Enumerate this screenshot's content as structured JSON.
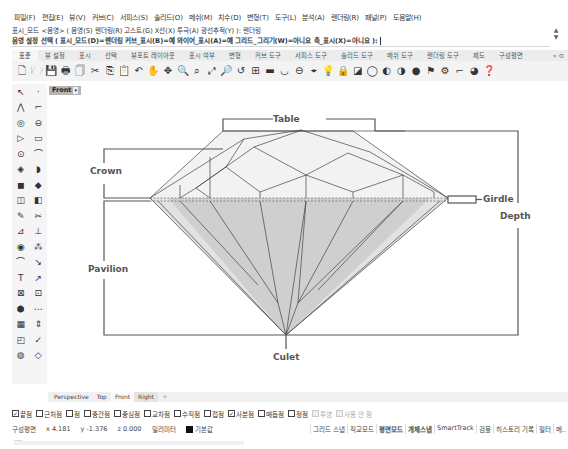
{
  "menubar": {
    "items": [
      "파일(F)",
      "편집(E)",
      "뷰(V)",
      "커브(C)",
      "서피스(S)",
      "솔리드(O)",
      "메쉬(M)",
      "치수(D)",
      "변형(T)",
      "도구(L)",
      "분석(A)",
      "렌더링(R)",
      "패널(P)",
      "도움말(H)"
    ]
  },
  "command": {
    "history_line": "표시_모드 <음영> ( 음영(S)  렌더링(R)  고스트(G)  X선(X)  투극(A)  광선추적(Y) ): 렌더링",
    "prompt_line": "음영 설정 선택 ( 표시_모드(D)=렌더링  커브_표시(B)=예  와이어_표시(A)=예  그리드_그리기(W)=아니요  축_표시(X)=아니요 ):",
    "scroll_up": "▲",
    "scroll_down": "▼"
  },
  "toolbar_tabs": {
    "tabs": [
      "표준",
      "뷰 설정",
      "표시",
      "선택",
      "뷰포트 레이아웃",
      "표시 여부",
      "변형",
      "커브 도구",
      "서피스 도구",
      "솔리드 도구",
      "메쉬 도구",
      "렌더링 도구",
      "제도",
      "구성평면"
    ],
    "active_index": 0,
    "more": "» ⊙"
  },
  "toolbar": {
    "icons": [
      {
        "name": "new-file-icon",
        "glyph": "🗋"
      },
      {
        "name": "open-folder-icon",
        "glyph": "🗁"
      },
      {
        "name": "save-icon",
        "glyph": "💾"
      },
      {
        "name": "print-icon",
        "glyph": "🖶"
      },
      {
        "name": "import-icon",
        "glyph": "🗍"
      },
      {
        "name": "cut-icon",
        "glyph": "✂"
      },
      {
        "name": "copy-icon",
        "glyph": "⎘"
      },
      {
        "name": "paste-icon",
        "glyph": "📋"
      },
      {
        "name": "undo-icon",
        "glyph": "↶"
      },
      {
        "name": "pan-hand-icon",
        "glyph": "✋"
      },
      {
        "name": "rotate-view-icon",
        "glyph": "✥"
      },
      {
        "name": "zoom-dynamic-icon",
        "glyph": "🔍"
      },
      {
        "name": "zoom-window-icon",
        "glyph": "⌕"
      },
      {
        "name": "zoom-extents-icon",
        "glyph": "⤢"
      },
      {
        "name": "zoom-selected-icon",
        "glyph": "🔎"
      },
      {
        "name": "undo-view-icon",
        "glyph": "↺"
      },
      {
        "name": "viewport-layout-icon",
        "glyph": "⊞"
      },
      {
        "name": "cplane-icon",
        "glyph": "▬"
      },
      {
        "name": "set-view-icon",
        "glyph": "◡"
      },
      {
        "name": "named-view-icon",
        "glyph": "⊖"
      },
      {
        "name": "osnap-icon",
        "glyph": "⌖"
      },
      {
        "name": "light-bulb-icon",
        "glyph": "💡"
      },
      {
        "name": "lock-icon",
        "glyph": "🔒"
      },
      {
        "name": "layer-icon",
        "glyph": "◪"
      },
      {
        "name": "wireframe-sphere-icon",
        "glyph": "◯"
      },
      {
        "name": "shaded-sphere-icon",
        "glyph": "◐"
      },
      {
        "name": "rendered-sphere-icon",
        "glyph": "◑"
      },
      {
        "name": "render-sphere-icon",
        "glyph": "●"
      },
      {
        "name": "material-icon",
        "glyph": "⚑"
      },
      {
        "name": "settings-gear-icon",
        "glyph": "⚙"
      },
      {
        "name": "dimension-icon",
        "glyph": "⌐"
      },
      {
        "name": "environment-icon",
        "glyph": "◕"
      },
      {
        "name": "help-icon",
        "glyph": "❓"
      }
    ]
  },
  "sidebar": {
    "rows": [
      [
        "select-arrow-icon",
        "point-icon"
      ],
      [
        "polyline-icon",
        "curve-control-points-icon"
      ],
      [
        "circle-icon",
        "ellipse-icon"
      ],
      [
        "arc-icon",
        "rectangle-icon"
      ],
      [
        "polygon-icon",
        "fillet-curve-icon"
      ],
      [
        "surface-icon",
        "extrude-surface-icon"
      ],
      [
        "box-solid-icon",
        "solid-union-icon"
      ],
      [
        "mesh-icon",
        "mesh-tools-icon"
      ],
      [
        "boolean-icon",
        "split-icon"
      ],
      [
        "trim-icon",
        "join-icon"
      ],
      [
        "group-icon",
        "explode-icon"
      ],
      [
        "move-icon",
        "fillet-edge-icon"
      ],
      [
        "text-icon",
        "dimension-tool-icon"
      ],
      [
        "block-icon",
        "array-icon"
      ],
      [
        "render-mesh-icon",
        "gumball-icon"
      ],
      [
        "grid-array-icon",
        "align-icon"
      ],
      [
        "analyze-icon",
        "check-icon"
      ],
      [
        "transform-icon",
        "cage-edit-icon"
      ]
    ],
    "glyphs": [
      [
        "↖",
        "·"
      ],
      [
        "⋀",
        "⌐"
      ],
      [
        "◎",
        "⊖"
      ],
      [
        "▷",
        "▭"
      ],
      [
        "⊙",
        "⌒"
      ],
      [
        "◈",
        "◗"
      ],
      [
        "◼",
        "◆"
      ],
      [
        "◫",
        "◧"
      ],
      [
        "✎",
        "✂"
      ],
      [
        "⊿",
        "⊥"
      ],
      [
        "◉",
        "⁂"
      ],
      [
        "⌒",
        "↘"
      ],
      [
        "T",
        "↗"
      ],
      [
        "⊠",
        "⊡"
      ],
      [
        "⬢",
        "⋯"
      ],
      [
        "▦",
        "⇕"
      ],
      [
        "◰",
        "✓"
      ],
      [
        "◍",
        "◇"
      ]
    ]
  },
  "viewport": {
    "label": "Front",
    "dropdown": "▾",
    "diagram_labels": {
      "table": "Table",
      "crown": "Crown",
      "girdle": "Girdle",
      "depth": "Depth",
      "pavilion": "Pavilion",
      "culet": "Culet"
    }
  },
  "viewport_tabs": {
    "tabs": [
      "Perspective",
      "Top",
      "Front",
      "Right"
    ],
    "active": "Right",
    "add": "+"
  },
  "osnap": {
    "items": [
      {
        "label": "끝점",
        "checked": true,
        "enabled": true
      },
      {
        "label": "근처점",
        "checked": false,
        "enabled": true
      },
      {
        "label": "점",
        "checked": false,
        "enabled": true
      },
      {
        "label": "중간점",
        "checked": false,
        "enabled": true
      },
      {
        "label": "중심점",
        "checked": false,
        "enabled": true
      },
      {
        "label": "교차점",
        "checked": false,
        "enabled": true
      },
      {
        "label": "수직점",
        "checked": false,
        "enabled": true
      },
      {
        "label": "접점",
        "checked": false,
        "enabled": true
      },
      {
        "label": "사분점",
        "checked": true,
        "enabled": true
      },
      {
        "label": "매듭점",
        "checked": false,
        "enabled": true
      },
      {
        "label": "정점",
        "checked": false,
        "enabled": true
      },
      {
        "label": "투영",
        "checked": false,
        "enabled": false
      },
      {
        "label": "사용 안 함",
        "checked": false,
        "enabled": false
      }
    ]
  },
  "statusbar": {
    "cplane": "구성평면",
    "x": "x 4.181",
    "y": "y -1.376",
    "z": "z 0.000",
    "units": "밀리미터",
    "layer": "기본값",
    "layer_color": "#111111",
    "modes": [
      {
        "label": "그리드 스냅",
        "on": false
      },
      {
        "label": "직교모드",
        "on": false
      },
      {
        "label": "평면모드",
        "on": true
      },
      {
        "label": "개체스냅",
        "on": true
      },
      {
        "label": "SmartTrack",
        "on": false
      },
      {
        "label": "검볼",
        "on": false
      },
      {
        "label": "히스토리 기록",
        "on": false
      },
      {
        "label": "필터",
        "on": false
      },
      {
        "label": "메..",
        "on": false
      }
    ]
  }
}
